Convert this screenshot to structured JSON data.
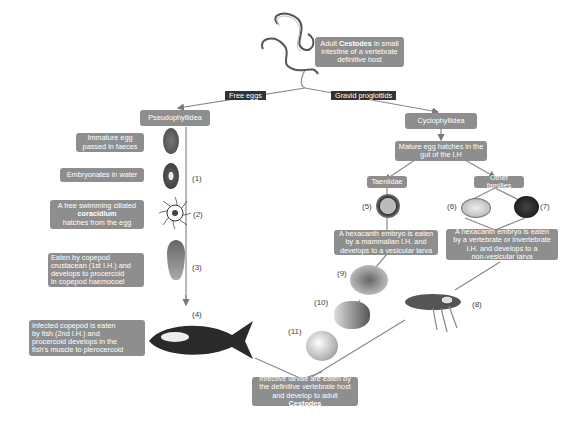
{
  "top": {
    "adult_box": [
      "Adult ",
      "Cestodes",
      " in small",
      "intestine of a vertebrate",
      "definitive host"
    ]
  },
  "branches": {
    "left_label": "Free eggs",
    "right_label": "Gravid proglottids"
  },
  "left": {
    "order": "Pseudophyllidea",
    "steps": [
      {
        "text": [
          "Immature egg",
          "passed in faeces"
        ]
      },
      {
        "text": [
          "Embryonates in water"
        ],
        "num": "(1)"
      },
      {
        "text": [
          "A free swimming ciliated",
          "coracidium",
          "hatches from the egg"
        ],
        "num": "(2)"
      },
      {
        "text": [
          "Eaten by copepod",
          "crustacean (1st I.H.) and",
          "develops to procercoid",
          "in copepod haemocoel"
        ],
        "num": "(3)"
      },
      {
        "text": [
          "Infected copepod is eaten",
          "by fish  (2nd I.H.) and",
          "procercoid develops in the",
          "fish's muscle  to plerocercoid"
        ],
        "num": "(4)"
      }
    ]
  },
  "right": {
    "order": "Cyclophyllidea",
    "hatch": [
      "Mature egg hatches in the",
      "gut of the I.H"
    ],
    "taeniidae": {
      "label": "Taeniidae",
      "num": "(5)",
      "text": [
        "A hexacanth embryo is eaten",
        "by a mammalian I.H. and",
        "develops to a vesicular larva"
      ],
      "stages": [
        "(9)",
        "(10)",
        "(11)"
      ]
    },
    "other": {
      "label": "Other families",
      "nums": [
        "(6)",
        "(7)",
        "(8)"
      ],
      "text": [
        "A hexacanth embryo is eaten",
        "by a vertebrate or invertebrate",
        "I.H. and develops to a",
        "non-vesicular larva"
      ]
    }
  },
  "bottom": {
    "text": [
      "Infective larvae are eaten by",
      "the definitive vertebrate host",
      "and develop to adult ",
      "Cestodes"
    ]
  },
  "colors": {
    "box": "#8e8e8e",
    "label_dark": "#333333",
    "line": "#8a8a8a"
  }
}
